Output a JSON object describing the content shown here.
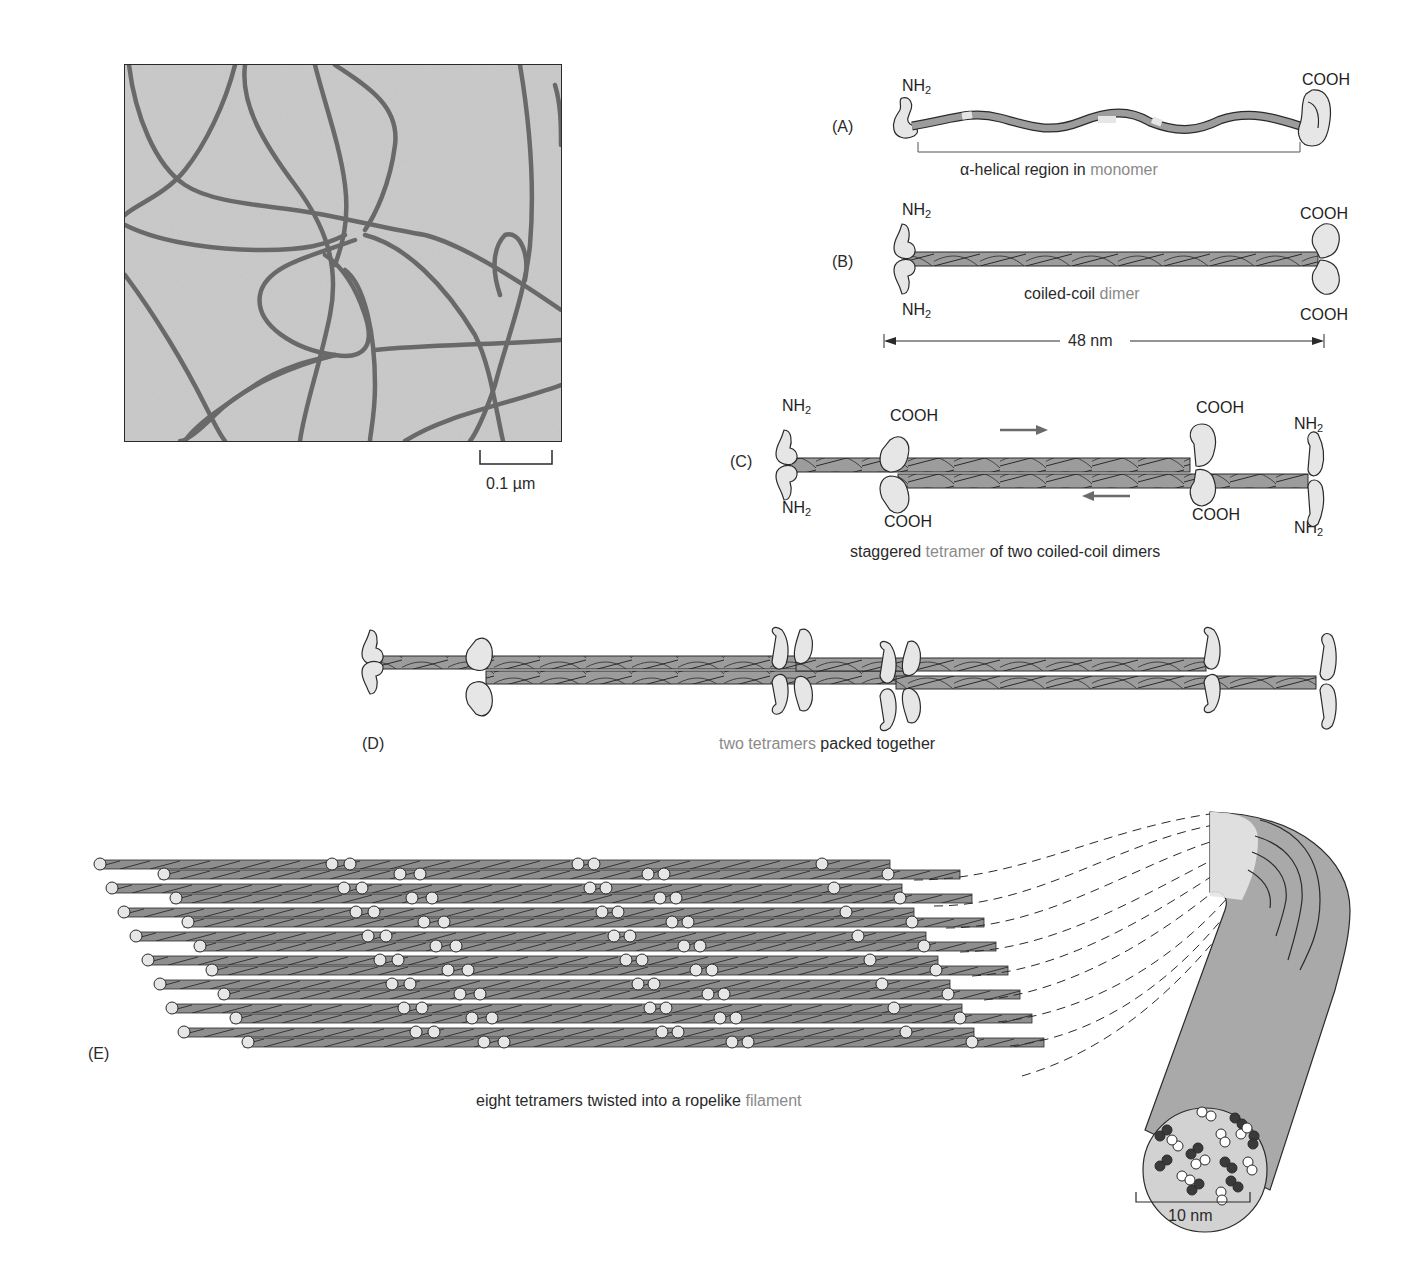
{
  "micrograph": {
    "scale_bar_label": "0.1 µm"
  },
  "panels": {
    "A": {
      "letter": "(A)",
      "n_terminus": "NH",
      "n_sub": "2",
      "c_terminus": "COOH",
      "caption_pre": "α-helical region in ",
      "caption_hl": "monomer"
    },
    "B": {
      "letter": "(B)",
      "n_terminus_top": "NH",
      "n_terminus_bottom": "NH",
      "n_sub": "2",
      "c_terminus_top": "COOH",
      "c_terminus_bottom": "COOH",
      "caption_pre": "coiled-coil ",
      "caption_hl": "dimer",
      "length_label": "48 nm"
    },
    "C": {
      "letter": "(C)",
      "left_n_top": "NH",
      "left_n_bottom": "NH",
      "n_sub": "2",
      "mid_c_top": "COOH",
      "mid_c_bottom": "COOH",
      "right_c_top": "COOH",
      "right_c_bottom": "COOH",
      "right_n_top": "NH",
      "right_n_bottom": "NH",
      "caption_pre": "staggered ",
      "caption_hl": "tetramer",
      "caption_post": " of two coiled-coil dimers"
    },
    "D": {
      "letter": "(D)",
      "caption_hl": "two tetramers",
      "caption_post": " packed together"
    },
    "E": {
      "letter": "(E)",
      "caption_pre": "eight tetramers twisted into a ropelike ",
      "caption_hl": "filament",
      "diameter_label": "10 nm"
    }
  },
  "colors": {
    "helix": "#9c9c9c",
    "head": "#e6e6e6",
    "highlight_text": "#8a8a8a",
    "filament": "#a9a9a9",
    "outline": "#2a2a2a"
  }
}
